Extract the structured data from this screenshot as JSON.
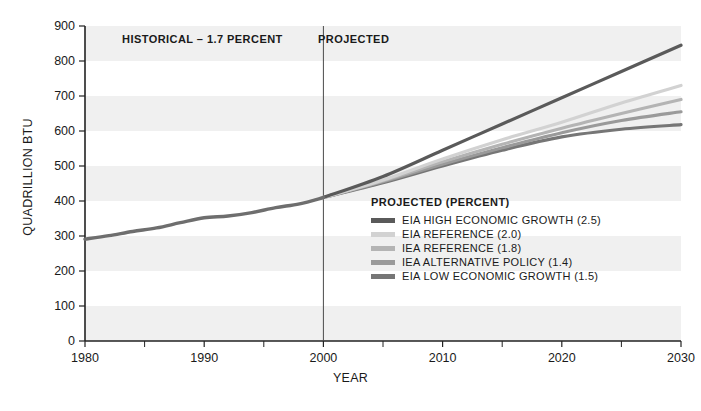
{
  "chart_data": {
    "type": "line",
    "title": "",
    "xlabel": "YEAR",
    "ylabel": "QUADRILLION BTU",
    "xlim": [
      1980,
      2030
    ],
    "ylim": [
      0,
      900
    ],
    "xticks": [
      1980,
      1990,
      2000,
      2010,
      2020,
      2030
    ],
    "xtick_labels": [
      "1980",
      "1990",
      "2000",
      "2010",
      "2020",
      "2030"
    ],
    "xminor_step": 5,
    "yticks": [
      0,
      100,
      200,
      300,
      400,
      500,
      600,
      700,
      800,
      900
    ],
    "ytick_labels": [
      "0",
      "100",
      "200",
      "300",
      "400",
      "500",
      "600",
      "700",
      "800",
      "900"
    ],
    "grid": false,
    "banded_background": true,
    "band_color": "#f0f0f0",
    "legend_position": "inside-center-right",
    "annotations": [
      {
        "name": "historical-label",
        "text": "HISTORICAL – 1.7 PERCENT",
        "x": 1990,
        "y": 865
      },
      {
        "name": "projected-label",
        "text": "PROJECTED",
        "x": 2004,
        "y": 865
      },
      {
        "name": "divider",
        "text": "",
        "x": 2000,
        "y": 0
      }
    ],
    "divider_year": 2000,
    "historical": {
      "name": "HISTORICAL",
      "color": "#6e6e6e",
      "x": [
        1980,
        1982,
        1984,
        1986,
        1988,
        1990,
        1992,
        1994,
        1996,
        1998,
        2000
      ],
      "values": [
        291,
        301,
        313,
        323,
        338,
        352,
        357,
        367,
        381,
        392,
        410
      ]
    },
    "series": [
      {
        "name": "EIA HIGH ECONOMIC GROWTH (2.5)",
        "label": "EIA HIGH ECONOMIC GROWTH (2.5)",
        "percent": 2.5,
        "color": "#5a5a5a",
        "x": [
          2000,
          2005,
          2010,
          2015,
          2020,
          2025,
          2030
        ],
        "values": [
          410,
          470,
          545,
          620,
          695,
          770,
          845
        ]
      },
      {
        "name": "EIA REFERENCE (2.0)",
        "label": "EIA REFERENCE (2.0)",
        "percent": 2.0,
        "color": "#d2d2d2",
        "x": [
          2000,
          2005,
          2010,
          2015,
          2020,
          2025,
          2030
        ],
        "values": [
          410,
          460,
          520,
          575,
          625,
          680,
          730
        ]
      },
      {
        "name": "IEA REFERENCE (1.8)",
        "label": "IEA REFERENCE (1.8)",
        "percent": 1.8,
        "color": "#b4b4b4",
        "x": [
          2000,
          2005,
          2010,
          2015,
          2020,
          2025,
          2030
        ],
        "values": [
          410,
          458,
          512,
          562,
          608,
          650,
          690
        ]
      },
      {
        "name": "IEA ALTERNATIVE POLICY (1.4)",
        "label": "IEA ALTERNATIVE POLICY (1.4)",
        "percent": 1.4,
        "color": "#9a9a9a",
        "x": [
          2000,
          2005,
          2010,
          2015,
          2020,
          2025,
          2030
        ],
        "values": [
          410,
          455,
          505,
          552,
          595,
          630,
          655
        ]
      },
      {
        "name": "EIA LOW ECONOMIC GROWTH (1.5)",
        "label": "EIA LOW ECONOMIC GROWTH (1.5)",
        "percent": 1.5,
        "color": "#767676",
        "x": [
          2000,
          2005,
          2010,
          2015,
          2020,
          2025,
          2030
        ],
        "values": [
          410,
          452,
          500,
          545,
          583,
          605,
          618
        ]
      }
    ]
  },
  "legend": {
    "title": "PROJECTED (PERCENT)"
  },
  "axes": {
    "y_title": "QUADRILLION BTU",
    "x_title": "YEAR"
  }
}
